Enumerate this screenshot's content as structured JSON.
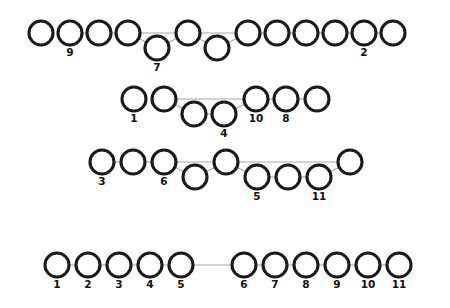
{
  "figure": {
    "title": "",
    "background_color": "#ffffff",
    "node_fill": "#ffffff",
    "node_stroke": "#1a1a1a",
    "edge_color": "#a8a8a8",
    "label_color": "#111111",
    "node_radius": 12,
    "node_stroke_width": 3.1,
    "row_count": 4
  },
  "chart_data": {
    "type": "diagram",
    "title": "",
    "xlabel": "",
    "ylabel": "",
    "rows": [
      {
        "row_index": 1,
        "baseline_y": 33,
        "drop_y": 48,
        "node_count": 12,
        "nodes": [
          {
            "index": 1,
            "cx": 41,
            "cy": 33,
            "dropped": false,
            "label": ""
          },
          {
            "index": 2,
            "cx": 70,
            "cy": 33,
            "dropped": false,
            "label": "9"
          },
          {
            "index": 3,
            "cx": 99,
            "cy": 33,
            "dropped": false,
            "label": ""
          },
          {
            "index": 4,
            "cx": 128,
            "cy": 33,
            "dropped": false,
            "label": ""
          },
          {
            "index": 5,
            "cx": 157,
            "cy": 48,
            "dropped": true,
            "label": "7"
          },
          {
            "index": 6,
            "cx": 188,
            "cy": 33,
            "dropped": false,
            "label": ""
          },
          {
            "index": 7,
            "cx": 217,
            "cy": 48,
            "dropped": true,
            "label": ""
          },
          {
            "index": 8,
            "cx": 248,
            "cy": 33,
            "dropped": false,
            "label": ""
          },
          {
            "index": 9,
            "cx": 277,
            "cy": 33,
            "dropped": false,
            "label": ""
          },
          {
            "index": 10,
            "cx": 306,
            "cy": 33,
            "dropped": false,
            "label": ""
          },
          {
            "index": 11,
            "cx": 335,
            "cy": 33,
            "dropped": false,
            "label": ""
          },
          {
            "index": 12,
            "cx": 364,
            "cy": 33,
            "dropped": false,
            "label": "2"
          },
          {
            "index": 13,
            "cx": 393,
            "cy": 33,
            "dropped": false,
            "label": ""
          }
        ],
        "edges": [
          {
            "from": 2,
            "to": 3
          },
          {
            "from": 3,
            "to": 4
          },
          {
            "from": 4,
            "to": 5
          },
          {
            "from": 4,
            "to": 6
          },
          {
            "from": 5,
            "to": 6
          },
          {
            "from": 6,
            "to": 7
          },
          {
            "from": 6,
            "to": 8
          },
          {
            "from": 7,
            "to": 8
          },
          {
            "from": 8,
            "to": 9
          },
          {
            "from": 9,
            "to": 10
          },
          {
            "from": 10,
            "to": 11
          },
          {
            "from": 11,
            "to": 12
          },
          {
            "from": 12,
            "to": 13
          }
        ]
      },
      {
        "row_index": 2,
        "baseline_y": 99,
        "drop_y": 114,
        "node_count": 8,
        "nodes": [
          {
            "index": 1,
            "cx": 134,
            "cy": 99,
            "dropped": false,
            "label": "1"
          },
          {
            "index": 2,
            "cx": 164,
            "cy": 99,
            "dropped": false,
            "label": ""
          },
          {
            "index": 3,
            "cx": 194,
            "cy": 114,
            "dropped": true,
            "label": ""
          },
          {
            "index": 4,
            "cx": 224,
            "cy": 114,
            "dropped": true,
            "label": "4"
          },
          {
            "index": 5,
            "cx": 256,
            "cy": 99,
            "dropped": false,
            "label": "10"
          },
          {
            "index": 6,
            "cx": 286,
            "cy": 99,
            "dropped": false,
            "label": "8"
          },
          {
            "index": 7,
            "cx": 317,
            "cy": 99,
            "dropped": false,
            "label": ""
          }
        ],
        "edges": [
          {
            "from": 2,
            "to": 3
          },
          {
            "from": 2,
            "to": 5
          },
          {
            "from": 3,
            "to": 4
          },
          {
            "from": 4,
            "to": 5
          },
          {
            "from": 5,
            "to": 6
          },
          {
            "from": 6,
            "to": 7
          }
        ]
      },
      {
        "row_index": 3,
        "baseline_y": 162,
        "drop_y": 177,
        "node_count": 9,
        "nodes": [
          {
            "index": 1,
            "cx": 102,
            "cy": 162,
            "dropped": false,
            "label": "3"
          },
          {
            "index": 2,
            "cx": 133,
            "cy": 162,
            "dropped": false,
            "label": ""
          },
          {
            "index": 3,
            "cx": 164,
            "cy": 162,
            "dropped": false,
            "label": "6"
          },
          {
            "index": 4,
            "cx": 195,
            "cy": 177,
            "dropped": true,
            "label": ""
          },
          {
            "index": 5,
            "cx": 226,
            "cy": 162,
            "dropped": false,
            "label": ""
          },
          {
            "index": 6,
            "cx": 257,
            "cy": 177,
            "dropped": true,
            "label": "5"
          },
          {
            "index": 7,
            "cx": 288,
            "cy": 177,
            "dropped": true,
            "label": ""
          },
          {
            "index": 8,
            "cx": 319,
            "cy": 177,
            "dropped": true,
            "label": "11"
          },
          {
            "index": 9,
            "cx": 350,
            "cy": 162,
            "dropped": false,
            "label": ""
          }
        ],
        "edges": [
          {
            "from": 1,
            "to": 2
          },
          {
            "from": 2,
            "to": 3
          },
          {
            "from": 3,
            "to": 4
          },
          {
            "from": 3,
            "to": 5
          },
          {
            "from": 4,
            "to": 5
          },
          {
            "from": 5,
            "to": 6
          },
          {
            "from": 5,
            "to": 9
          },
          {
            "from": 6,
            "to": 7
          },
          {
            "from": 7,
            "to": 8
          },
          {
            "from": 8,
            "to": 9
          }
        ]
      },
      {
        "row_index": 4,
        "baseline_y": 265,
        "drop_y": 265,
        "node_count": 11,
        "nodes": [
          {
            "index": 1,
            "cx": 57,
            "cy": 265,
            "dropped": false,
            "label": "1"
          },
          {
            "index": 2,
            "cx": 88,
            "cy": 265,
            "dropped": false,
            "label": "2"
          },
          {
            "index": 3,
            "cx": 119,
            "cy": 265,
            "dropped": false,
            "label": "3"
          },
          {
            "index": 4,
            "cx": 150,
            "cy": 265,
            "dropped": false,
            "label": "4"
          },
          {
            "index": 5,
            "cx": 181,
            "cy": 265,
            "dropped": false,
            "label": "5"
          },
          {
            "index": 6,
            "cx": 244,
            "cy": 265,
            "dropped": false,
            "label": "6"
          },
          {
            "index": 7,
            "cx": 275,
            "cy": 265,
            "dropped": false,
            "label": "7"
          },
          {
            "index": 8,
            "cx": 306,
            "cy": 265,
            "dropped": false,
            "label": "8"
          },
          {
            "index": 9,
            "cx": 337,
            "cy": 265,
            "dropped": false,
            "label": "9"
          },
          {
            "index": 10,
            "cx": 368,
            "cy": 265,
            "dropped": false,
            "label": "10"
          },
          {
            "index": 11,
            "cx": 399,
            "cy": 265,
            "dropped": false,
            "label": "11"
          }
        ],
        "edges": [
          {
            "from": 1,
            "to": 2
          },
          {
            "from": 2,
            "to": 3
          },
          {
            "from": 3,
            "to": 4
          },
          {
            "from": 4,
            "to": 5
          },
          {
            "from": 5,
            "to": 6
          },
          {
            "from": 6,
            "to": 7
          },
          {
            "from": 7,
            "to": 8
          },
          {
            "from": 8,
            "to": 9
          },
          {
            "from": 9,
            "to": 10
          },
          {
            "from": 10,
            "to": 11
          }
        ]
      }
    ]
  }
}
